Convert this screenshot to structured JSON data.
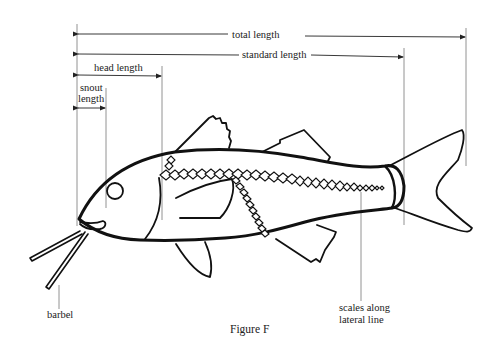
{
  "figure": {
    "caption": "Figure F"
  },
  "measurements": {
    "total_length": "total length",
    "standard_length": "standard length",
    "head_length": "head length",
    "snout_length_line1": "snout",
    "snout_length_line2": "length"
  },
  "labels": {
    "barbel": "barbel",
    "scales_line1": "scales along",
    "scales_line2": "lateral line"
  },
  "colors": {
    "ink": "#111111",
    "guide": "#777777",
    "background": "#ffffff"
  }
}
